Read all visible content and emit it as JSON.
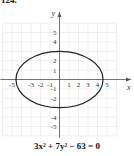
{
  "problem_number": "124.",
  "chart_data": {
    "type": "line",
    "title": "",
    "equation": "3x² + 7y² − 63 = 0",
    "xlabel": "x",
    "ylabel": "y",
    "xlim": [
      -6,
      6
    ],
    "ylim": [
      -6,
      6
    ],
    "grid": true,
    "x_ticks": [
      -5,
      -3,
      -2,
      -1,
      1,
      2,
      3,
      4,
      5
    ],
    "x_tick_labels": [
      "-5",
      "-3",
      "-2",
      "-1",
      "1",
      "2",
      "3",
      "4",
      "5"
    ],
    "y_ticks": [
      5,
      4,
      2,
      1,
      -1,
      -2,
      -4,
      -5
    ],
    "y_tick_labels": [
      "5",
      "4",
      "2",
      "1",
      "-1",
      "-2",
      "-4",
      "-5"
    ],
    "series": [
      {
        "name": "ellipse",
        "shape": "ellipse",
        "center": [
          0,
          0
        ],
        "semi_axis_x": 4.583,
        "semi_axis_y": 3,
        "color": "#222222"
      }
    ]
  }
}
